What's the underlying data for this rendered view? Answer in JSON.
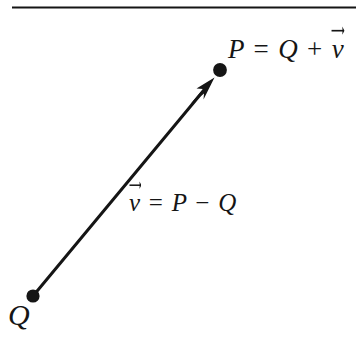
{
  "figure": {
    "name": "vector-between-two-points",
    "background_color": "#ffffff",
    "ink_color": "#151515",
    "rule": {
      "name": "top-horizontal-rule",
      "x1": 12,
      "y1": 7,
      "x2": 356,
      "y2": 7,
      "thickness": 2
    },
    "points": [
      {
        "id": "Q",
        "label": "Q",
        "cx": 33,
        "cy": 296,
        "r": 6.5
      },
      {
        "id": "P",
        "label": "P",
        "cx": 220,
        "cy": 70,
        "r": 6.8
      }
    ],
    "arrow": {
      "name": "vector-arrow-q-to-p",
      "from": [
        33,
        296
      ],
      "to": [
        213,
        79
      ],
      "thickness": 3,
      "head_length": 26,
      "head_half_width": 7
    },
    "labels": {
      "point_p": {
        "text": "P = Q + v",
        "parts": {
          "p": "P",
          "equals": "=",
          "q": "Q",
          "plus": "+",
          "v": "v"
        },
        "vector_over": "v",
        "x": 228,
        "y": 36,
        "font_size": 27
      },
      "vector_definition": {
        "text": "v = P − Q",
        "parts": {
          "v": "v",
          "equals": "=",
          "p": "P",
          "minus": "−",
          "q": "Q"
        },
        "vector_over": "v",
        "x": 129,
        "y": 190,
        "font_size": 25
      },
      "point_q": {
        "text": "Q",
        "x": 8,
        "y": 300,
        "font_size": 30
      }
    }
  }
}
